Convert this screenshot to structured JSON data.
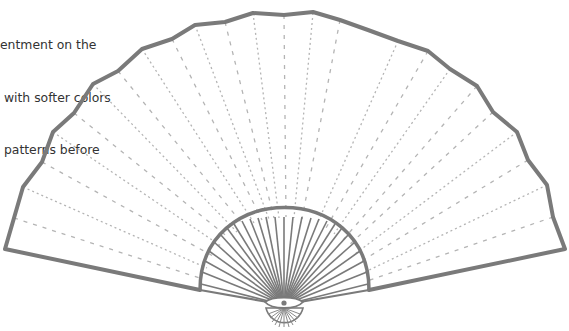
{
  "caption": {
    "lines": [
      "entment on the",
      " with softer colors",
      " patterns before"
    ]
  },
  "figure": {
    "outline_color": "#7a7a7a",
    "rib_color": "#b0b0b0",
    "hub_icon": "pivot-rivet-icon"
  }
}
